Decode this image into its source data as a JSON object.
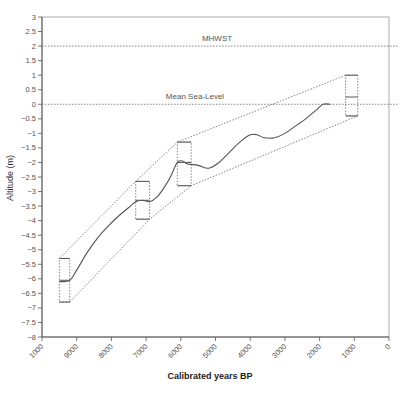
{
  "chart_data": {
    "type": "line",
    "title": "",
    "xlabel": "Calibrated years BP",
    "ylabel": "Altitude (m)",
    "xlim": [
      10000,
      0
    ],
    "ylim": [
      -8,
      3
    ],
    "x_reversed": true,
    "grid": false,
    "frame": "box",
    "x_ticks": [
      10000,
      9000,
      8000,
      7000,
      6000,
      5000,
      4000,
      3000,
      2000,
      1000,
      0
    ],
    "x_tick_labels": [
      "1000",
      "9000",
      "8000",
      "7000",
      "6000",
      "5000",
      "4000",
      "3000",
      "2000",
      "1000",
      "0"
    ],
    "y_ticks": [
      3,
      2.5,
      2,
      1.5,
      1,
      0.5,
      0,
      -0.5,
      -1,
      -1.5,
      -2,
      -2.5,
      -3,
      -3.5,
      -4,
      -4.5,
      -5,
      -5.5,
      -6,
      -6.5,
      -7,
      -7.5,
      -8
    ],
    "y_tick_labels": [
      "3",
      "2.5",
      "2",
      "1.5",
      "1",
      "0.5",
      "0",
      "-0.5",
      "-1",
      "-1.5",
      "-2",
      "-2.5",
      "-3",
      "-3.5",
      "-4",
      "-4.5",
      "-5",
      "-5.5",
      "-6",
      "-6.5",
      "-7",
      "-7.5",
      "-8"
    ],
    "reference_lines": [
      {
        "name": "MHWST",
        "y": 2,
        "style": "dotted"
      },
      {
        "name": "Mean Sea-Level",
        "y": 0,
        "style": "dotted"
      }
    ],
    "series": [
      {
        "name": "Relative sea-level curve",
        "style": "solid",
        "x": [
          9500,
          9200,
          9000,
          8700,
          8400,
          8100,
          7800,
          7500,
          7300,
          7100,
          6900,
          6700,
          6500,
          6300,
          6100,
          5950,
          5800,
          5500,
          5200,
          4900,
          4600,
          4300,
          4000,
          3800,
          3600,
          3300,
          3000,
          2700,
          2400,
          2100,
          1900,
          1700
        ],
        "y": [
          -6.1,
          -6.05,
          -5.7,
          -5.1,
          -4.6,
          -4.2,
          -3.85,
          -3.55,
          -3.35,
          -3.3,
          -3.35,
          -3.2,
          -2.9,
          -2.5,
          -2.0,
          -1.95,
          -2.05,
          -2.1,
          -2.2,
          -2.0,
          -1.65,
          -1.3,
          -1.05,
          -1.05,
          -1.15,
          -1.15,
          -1.0,
          -0.75,
          -0.5,
          -0.2,
          0.0,
          0.0
        ]
      },
      {
        "name": "Upper envelope",
        "style": "dotted",
        "x": [
          9500,
          7300,
          6100,
          1250
        ],
        "y": [
          -5.3,
          -2.65,
          -1.3,
          1.0
        ]
      },
      {
        "name": "Lower envelope",
        "style": "dotted",
        "x": [
          9200,
          6900,
          5700,
          900
        ],
        "y": [
          -6.8,
          -3.95,
          -2.8,
          -0.4
        ]
      }
    ],
    "error_boxes": [
      {
        "x_min": 9500,
        "x_max": 9200,
        "y_min": -6.8,
        "y_max": -5.3,
        "mid": -6.05
      },
      {
        "x_min": 7300,
        "x_max": 6900,
        "y_min": -3.95,
        "y_max": -2.65,
        "mid": -3.3
      },
      {
        "x_min": 6100,
        "x_max": 5700,
        "y_min": -2.8,
        "y_max": -1.3,
        "mid": -2.0
      },
      {
        "x_min": 1250,
        "x_max": 900,
        "y_min": -0.4,
        "y_max": 1.0,
        "mid": 0.25
      }
    ]
  },
  "labels": {
    "xlabel": "Calibrated years BP",
    "ylabel": "Altitude (m)",
    "mhwst": "MHWST",
    "msl": "Mean Sea-Level"
  },
  "colors": {
    "axis": "#555555",
    "curve": "#555555",
    "dotted": "#777777"
  }
}
